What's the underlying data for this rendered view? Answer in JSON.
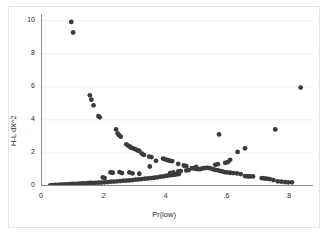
{
  "chart_data": {
    "type": "scatter",
    "title": "",
    "xlabel": "Pr(low)",
    "ylabel": "H-L dX^2",
    "xlim": [
      0.0,
      0.88
    ],
    "ylim": [
      0.0,
      10.4
    ],
    "xticks": [
      0,
      0.2,
      0.4,
      0.6,
      0.8
    ],
    "xticklabels": [
      "0",
      ".2",
      ".4",
      ".6",
      ".8"
    ],
    "yticks": [
      0,
      2,
      4,
      6,
      8,
      10
    ],
    "yticklabels": [
      "0",
      "2",
      "4",
      "6",
      "8",
      "10"
    ],
    "grid": "horizontal-faint",
    "legend": null,
    "marker": {
      "shape": "circle",
      "color": "#3b3b3b",
      "size": 2.4
    },
    "series": [
      {
        "name": "H-L dX^2 vs Pr(low)",
        "points": [
          [
            0.098,
            9.92
          ],
          [
            0.104,
            9.28
          ],
          [
            0.158,
            5.48
          ],
          [
            0.163,
            5.22
          ],
          [
            0.17,
            4.88
          ],
          [
            0.186,
            4.22
          ],
          [
            0.19,
            4.15
          ],
          [
            0.243,
            3.42
          ],
          [
            0.248,
            3.18
          ],
          [
            0.252,
            3.08
          ],
          [
            0.258,
            2.98
          ],
          [
            0.276,
            2.52
          ],
          [
            0.282,
            2.44
          ],
          [
            0.288,
            2.38
          ],
          [
            0.293,
            2.3
          ],
          [
            0.3,
            2.26
          ],
          [
            0.306,
            2.22
          ],
          [
            0.312,
            2.16
          ],
          [
            0.318,
            2.12
          ],
          [
            0.326,
            1.96
          ],
          [
            0.333,
            1.88
          ],
          [
            0.35,
            1.78
          ],
          [
            0.357,
            1.74
          ],
          [
            0.372,
            1.52
          ],
          [
            0.395,
            1.66
          ],
          [
            0.4,
            1.62
          ],
          [
            0.406,
            1.58
          ],
          [
            0.412,
            1.55
          ],
          [
            0.418,
            1.52
          ],
          [
            0.424,
            1.5
          ],
          [
            0.444,
            1.34
          ],
          [
            0.462,
            1.24
          ],
          [
            0.47,
            1.2
          ],
          [
            0.488,
            1.08
          ],
          [
            0.495,
            1.06
          ],
          [
            0.502,
            1.04
          ],
          [
            0.508,
            1.02
          ],
          [
            0.515,
            1.02
          ],
          [
            0.522,
            1.06
          ],
          [
            0.528,
            1.08
          ],
          [
            0.534,
            1.1
          ],
          [
            0.54,
            1.1
          ],
          [
            0.548,
            1.06
          ],
          [
            0.556,
            1.02
          ],
          [
            0.563,
            0.98
          ],
          [
            0.57,
            0.96
          ],
          [
            0.578,
            0.92
          ],
          [
            0.586,
            0.88
          ],
          [
            0.594,
            0.84
          ],
          [
            0.602,
            0.82
          ],
          [
            0.612,
            0.8
          ],
          [
            0.622,
            0.78
          ],
          [
            0.634,
            0.76
          ],
          [
            0.646,
            0.72
          ],
          [
            0.66,
            0.6
          ],
          [
            0.668,
            0.58
          ],
          [
            0.676,
            0.58
          ],
          [
            0.686,
            0.58
          ],
          [
            0.714,
            0.48
          ],
          [
            0.722,
            0.46
          ],
          [
            0.73,
            0.44
          ],
          [
            0.74,
            0.42
          ],
          [
            0.752,
            0.36
          ],
          [
            0.766,
            0.28
          ],
          [
            0.778,
            0.26
          ],
          [
            0.79,
            0.24
          ],
          [
            0.8,
            0.22
          ],
          [
            0.812,
            0.22
          ],
          [
            0.03,
            0.04
          ],
          [
            0.038,
            0.05
          ],
          [
            0.046,
            0.06
          ],
          [
            0.054,
            0.07
          ],
          [
            0.062,
            0.08
          ],
          [
            0.07,
            0.08
          ],
          [
            0.078,
            0.09
          ],
          [
            0.086,
            0.1
          ],
          [
            0.094,
            0.11
          ],
          [
            0.102,
            0.12
          ],
          [
            0.11,
            0.12
          ],
          [
            0.118,
            0.13
          ],
          [
            0.126,
            0.14
          ],
          [
            0.134,
            0.15
          ],
          [
            0.142,
            0.16
          ],
          [
            0.15,
            0.17
          ],
          [
            0.158,
            0.18
          ],
          [
            0.166,
            0.18
          ],
          [
            0.176,
            0.19
          ],
          [
            0.186,
            0.2
          ],
          [
            0.196,
            0.21
          ],
          [
            0.206,
            0.22
          ],
          [
            0.216,
            0.24
          ],
          [
            0.226,
            0.26
          ],
          [
            0.236,
            0.27
          ],
          [
            0.246,
            0.28
          ],
          [
            0.256,
            0.3
          ],
          [
            0.266,
            0.32
          ],
          [
            0.276,
            0.33
          ],
          [
            0.286,
            0.34
          ],
          [
            0.296,
            0.36
          ],
          [
            0.306,
            0.38
          ],
          [
            0.316,
            0.4
          ],
          [
            0.326,
            0.42
          ],
          [
            0.336,
            0.44
          ],
          [
            0.346,
            0.46
          ],
          [
            0.356,
            0.48
          ],
          [
            0.366,
            0.5
          ],
          [
            0.376,
            0.52
          ],
          [
            0.386,
            0.56
          ],
          [
            0.396,
            0.58
          ],
          [
            0.406,
            0.62
          ],
          [
            0.414,
            0.64
          ],
          [
            0.422,
            0.66
          ],
          [
            0.43,
            0.68
          ],
          [
            0.438,
            0.7
          ],
          [
            0.446,
            0.72
          ],
          [
            0.2,
            0.52
          ],
          [
            0.206,
            0.48
          ],
          [
            0.225,
            0.82
          ],
          [
            0.232,
            0.8
          ],
          [
            0.254,
            0.84
          ],
          [
            0.262,
            0.78
          ],
          [
            0.286,
            0.82
          ],
          [
            0.296,
            0.76
          ],
          [
            0.318,
            0.74
          ],
          [
            0.352,
            1.18
          ],
          [
            0.418,
            0.78
          ],
          [
            0.428,
            0.82
          ],
          [
            0.444,
            0.88
          ],
          [
            0.452,
            0.9
          ],
          [
            0.47,
            0.94
          ],
          [
            0.478,
            0.96
          ],
          [
            0.502,
            1.16
          ],
          [
            0.564,
            1.28
          ],
          [
            0.572,
            1.32
          ],
          [
            0.596,
            1.4
          ],
          [
            0.604,
            1.44
          ],
          [
            0.612,
            1.58
          ],
          [
            0.636,
            2.06
          ],
          [
            0.66,
            2.28
          ],
          [
            0.576,
            3.12
          ],
          [
            0.758,
            3.42
          ],
          [
            0.84,
            5.95
          ]
        ]
      }
    ]
  },
  "axes": {
    "y_axis_name": "y-axis",
    "x_axis_name": "x-axis"
  }
}
